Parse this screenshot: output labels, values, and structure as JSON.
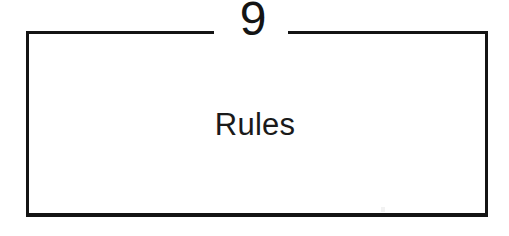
{
  "page": {
    "background_color": "#ffffff",
    "ink_color": "#141414",
    "width": 509,
    "height": 236
  },
  "chapter": {
    "number": "9",
    "title": "Rules"
  },
  "frame": {
    "border_color": "#141414",
    "border_width_px": 3,
    "has_top_rule_break": true
  }
}
